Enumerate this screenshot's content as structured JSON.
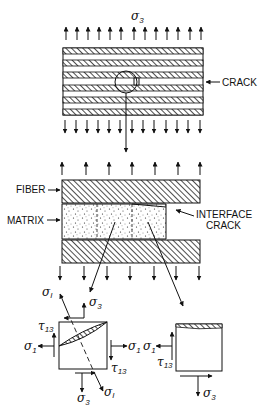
{
  "top_view": {
    "stress_label": "σ",
    "stress_sub": "3",
    "crack_label": "CRACK"
  },
  "middle_view": {
    "fiber_label": "FIBER",
    "matrix_label": "MATRIX",
    "interface_crack_line1": "INTERFACE",
    "interface_crack_line2": "CRACK"
  },
  "bottom_left": {
    "sigma_I_top": "σ",
    "sigma_I_top_sub": "I",
    "sigma3_top": "σ",
    "sigma3_top_sub": "3",
    "tau13_left": "τ",
    "tau13_left_sub": "13",
    "sigma1_left": "σ",
    "sigma1_left_sub": "1",
    "sigma1_right": "σ",
    "sigma1_right_sub": "1",
    "tau13_right": "τ",
    "tau13_right_sub": "13",
    "sigma3_bottom": "σ",
    "sigma3_bottom_sub": "3",
    "sigma_I_bottom": "σ",
    "sigma_I_bottom_sub": "I"
  },
  "bottom_right": {
    "sigma1": "σ",
    "sigma1_sub": "1",
    "tau13": "τ",
    "tau13_sub": "13",
    "sigma3": "σ",
    "sigma3_sub": "3"
  },
  "colors": {
    "ink": "#111111",
    "background": "#ffffff"
  }
}
